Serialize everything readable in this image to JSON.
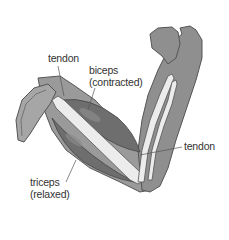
{
  "diagram": {
    "labels": {
      "tendon_top": "tendon",
      "biceps_line1": "biceps",
      "biceps_line2": "(contracted)",
      "tendon_right": "tendon",
      "triceps_line1": "triceps",
      "triceps_line2": "(relaxed)"
    },
    "colors": {
      "skin": "#8f8f8f",
      "skin_outline": "#555555",
      "muscle": "#6e6e6e",
      "bone": "#e8e8e8",
      "shoulder": "#a6a6a6",
      "leader_line": "#555555",
      "background": "#ffffff"
    }
  }
}
